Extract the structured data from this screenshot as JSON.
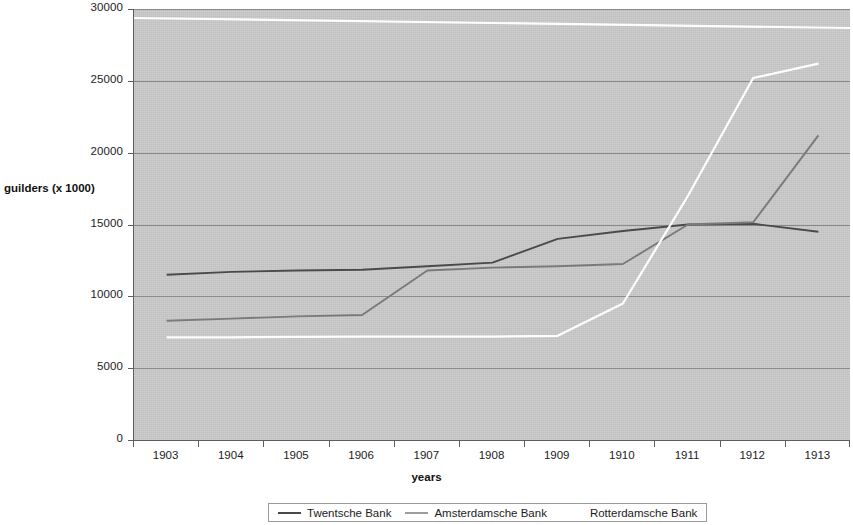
{
  "chart_data": {
    "type": "line",
    "title": "",
    "xlabel": "years",
    "ylabel": "guilders (x 1000)",
    "categories": [
      "1903",
      "1904",
      "1905",
      "1906",
      "1907",
      "1908",
      "1909",
      "1910",
      "1911",
      "1912",
      "1913"
    ],
    "ylim": [
      0,
      30000
    ],
    "y_ticks": [
      0,
      5000,
      10000,
      15000,
      20000,
      25000,
      30000
    ],
    "y_tick_labels": [
      "0",
      "5000",
      "10000",
      "15000",
      "20000",
      "25000",
      "30000"
    ],
    "grid": true,
    "legend_position": "bottom",
    "plot_background": "#c9c9c9",
    "series": [
      {
        "name": "Twentsche Bank",
        "color": "#4a4a4a",
        "values": [
          11500,
          11700,
          11800,
          11850,
          12100,
          12350,
          14000,
          14550,
          15000,
          15050,
          14500
        ]
      },
      {
        "name": "Amsterdamsche Bank",
        "color": "#7a7a7a",
        "values": [
          8300,
          8450,
          8600,
          8700,
          11800,
          12000,
          12100,
          12250,
          15000,
          15150,
          21200
        ]
      },
      {
        "name": "Rotterdamsche Bank",
        "color": "#ffffff",
        "values": [
          7150,
          7150,
          7180,
          7200,
          7200,
          7200,
          7250,
          9500,
          17000,
          25200,
          26200
        ]
      }
    ]
  },
  "legend": {
    "items": [
      {
        "label": "Twentsche Bank",
        "color": "#4a4a4a"
      },
      {
        "label": "Amsterdamsche Bank",
        "color": "#9d9d9d"
      },
      {
        "label": "Rotterdamsche Bank",
        "color": "#ffffff"
      }
    ]
  },
  "decoration": {
    "top_white_rule_color": "#ffffff"
  }
}
